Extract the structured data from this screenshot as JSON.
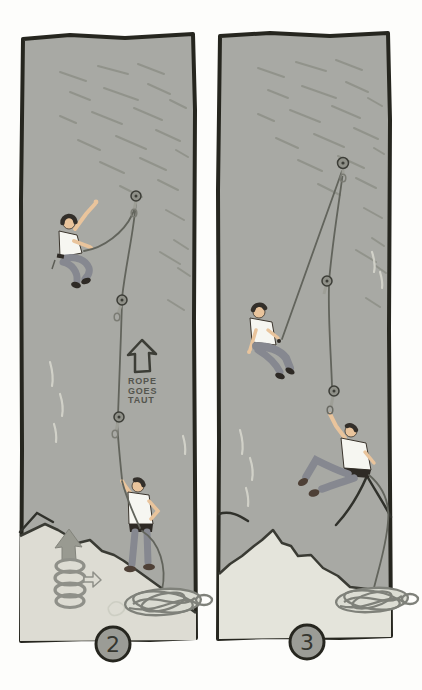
{
  "illustration": {
    "panels": [
      {
        "id": "panel-2",
        "badge": "2",
        "annotation": {
          "line1": "ROPE",
          "line2": "GOES",
          "line3": "TAUT"
        }
      },
      {
        "id": "panel-3",
        "badge": "3"
      }
    ],
    "colors": {
      "wall": "#a8a9a4",
      "ledge_left": "#dddcd3",
      "ledge_right": "#e4e4db",
      "outline": "#26261f",
      "rope": "#62645c",
      "shirt": "#f6f6f1",
      "pants": "#868890",
      "skin": "#e9c49c",
      "hair": "#332f2a",
      "badge_fill": "#9b9c96",
      "arrow_fill": "#999a91",
      "page": "#fdfdfb"
    }
  }
}
